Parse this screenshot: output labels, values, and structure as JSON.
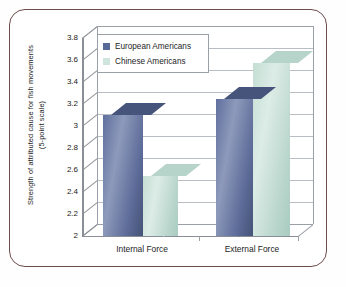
{
  "figure": {
    "frame_color": "#6e4b4b",
    "background": "#ffffff"
  },
  "chart_data": {
    "type": "bar",
    "title": "",
    "xlabel": "",
    "ylabel": "Strength of attributed cause for fish movements (5-point scale)",
    "ylabel_line1": "Strength of attributed cause for fish movements",
    "ylabel_line2": "(5-point scale)",
    "categories": [
      "Internal Force",
      "External Force"
    ],
    "series": [
      {
        "name": "European Americans",
        "color": "#5a6a98",
        "values": [
          3.1,
          3.25
        ]
      },
      {
        "name": "Chinese Americans",
        "color": "#cfe4dc",
        "values": [
          2.55,
          3.57
        ]
      }
    ],
    "ylim": [
      2,
      3.8
    ],
    "yticks": [
      "2",
      "2.2",
      "2.4",
      "2.6",
      "2.8",
      "3",
      "3.2",
      "3.4",
      "3.6",
      "3.8"
    ],
    "ytick_values": [
      2,
      2.2,
      2.4,
      2.6,
      2.8,
      3,
      3.2,
      3.4,
      3.6,
      3.8
    ],
    "grid": true,
    "legend_position": "top-left",
    "style": "3d-clustered-column"
  },
  "legend": {
    "items": [
      {
        "label": "European Americans",
        "color": "#5a6a98"
      },
      {
        "label": "Chinese Americans",
        "color": "#cfe4dc"
      }
    ]
  }
}
